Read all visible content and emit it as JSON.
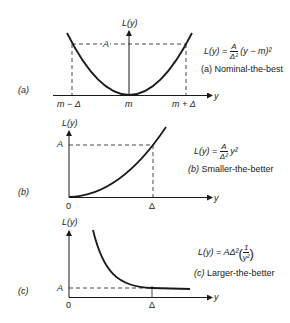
{
  "panels": [
    {
      "id": "a",
      "panel_label": "(a)",
      "y_axis_label": "L(y)",
      "x_axis_label": "y",
      "level_label": "A",
      "x_ticks": [
        "m − Δ",
        "m",
        "m + Δ"
      ],
      "formula": {
        "lhs": "L(y) =",
        "num": "A",
        "den": "Δ²",
        "rhs": "(y − m)²"
      },
      "caption_letter": "(a)",
      "caption": "Nominal-the-best"
    },
    {
      "id": "b",
      "panel_label": "(b)",
      "y_axis_label": "L(y)",
      "x_axis_label": "y",
      "level_label": "A",
      "x_ticks": [
        "0",
        "Δ"
      ],
      "formula": {
        "lhs": "L(y) =",
        "num": "A",
        "den": "Δ²",
        "rhs": "y²"
      },
      "caption_letter": "(b)",
      "caption": "Smaller-the-better"
    },
    {
      "id": "c",
      "panel_label": "(c)",
      "y_axis_label": "L(y)",
      "x_axis_label": "y",
      "level_label": "A",
      "x_ticks": [
        "0",
        "Δ"
      ],
      "formula": {
        "lhs": "L(y) = AΔ²",
        "num": "1",
        "den": "y²"
      },
      "caption_letter": "(c)",
      "caption": "Larger-the-better"
    }
  ],
  "colors": {
    "stroke": "#1a1a1a",
    "background": "#ffffff"
  }
}
